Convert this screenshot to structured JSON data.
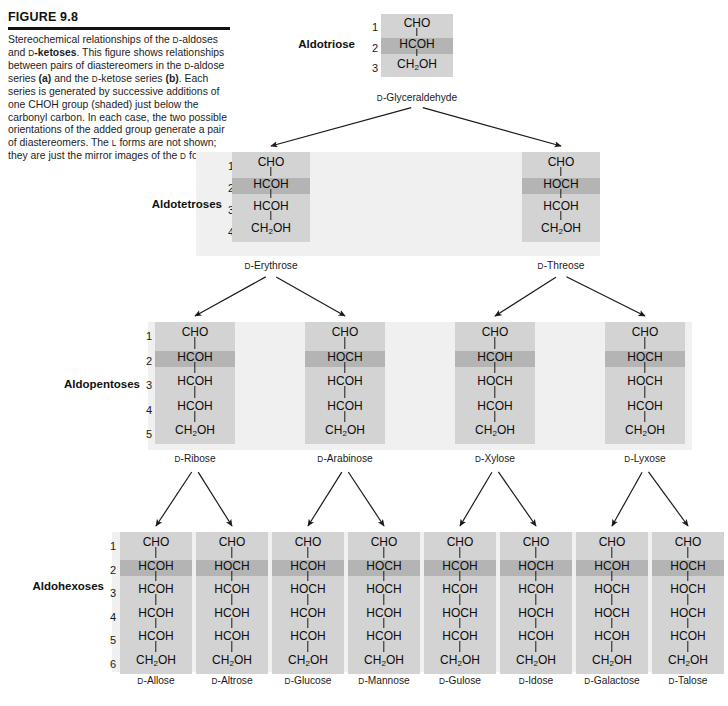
{
  "figure": {
    "number": "FIGURE 9.8",
    "caption_runs": [
      {
        "t": "Stereochemical relationships of the ",
        "s": "n"
      },
      {
        "t": "D",
        "s": "sc"
      },
      {
        "t": "-aldoses and ",
        "s": "n"
      },
      {
        "t": "D",
        "s": "sc"
      },
      {
        "t": "-ketoses",
        "s": "b"
      },
      {
        "t": ". This figure shows relationships between pairs of diastereomers in the ",
        "s": "n"
      },
      {
        "t": "D",
        "s": "sc"
      },
      {
        "t": "-aldose series ",
        "s": "n"
      },
      {
        "t": "(a)",
        "s": "b"
      },
      {
        "t": " and the ",
        "s": "n"
      },
      {
        "t": "D",
        "s": "sc"
      },
      {
        "t": "-ketose series ",
        "s": "n"
      },
      {
        "t": "(b)",
        "s": "b"
      },
      {
        "t": ". Each series is generated by successive additions of one CHOH group (shaded) just below the carbonyl carbon. In each case, the two possible orientations of the added group generate a pair of diastereomers. The ",
        "s": "n"
      },
      {
        "t": "L",
        "s": "sc"
      },
      {
        "t": " forms are not shown; they are just the mirror images of the ",
        "s": "n"
      },
      {
        "t": "D",
        "s": "sc"
      },
      {
        "t": " forms.",
        "s": "n"
      }
    ]
  },
  "colors": {
    "molecule_box": "#d3d3d3",
    "highlight_band": "#b4b4b4",
    "row_band": "#f0f0f0",
    "text": "#1a1a1a",
    "rule": "#111111"
  },
  "rows": [
    {
      "label": "Aldotriose",
      "carbon_numbers": [
        "1",
        "2",
        "3"
      ],
      "molecules": [
        {
          "name_prefix": "D",
          "name": "-Glyceraldehyde",
          "groups": [
            "CHO",
            "HCOH",
            "CH2OH"
          ],
          "highlight_index": 1
        }
      ]
    },
    {
      "label": "Aldotetroses",
      "carbon_numbers": [
        "1",
        "2",
        "3",
        "4"
      ],
      "molecules": [
        {
          "name_prefix": "D",
          "name": "-Erythrose",
          "groups": [
            "CHO",
            "HCOH",
            "HCOH",
            "CH2OH"
          ],
          "highlight_index": 1
        },
        {
          "name_prefix": "D",
          "name": "-Threose",
          "groups": [
            "CHO",
            "HOCH",
            "HCOH",
            "CH2OH"
          ],
          "highlight_index": 1
        }
      ]
    },
    {
      "label": "Aldopentoses",
      "carbon_numbers": [
        "1",
        "2",
        "3",
        "4",
        "5"
      ],
      "molecules": [
        {
          "name_prefix": "D",
          "name": "-Ribose",
          "groups": [
            "CHO",
            "HCOH",
            "HCOH",
            "HCOH",
            "CH2OH"
          ],
          "highlight_index": 1
        },
        {
          "name_prefix": "D",
          "name": "-Arabinose",
          "groups": [
            "CHO",
            "HOCH",
            "HCOH",
            "HCOH",
            "CH2OH"
          ],
          "highlight_index": 1
        },
        {
          "name_prefix": "D",
          "name": "-Xylose",
          "groups": [
            "CHO",
            "HCOH",
            "HOCH",
            "HCOH",
            "CH2OH"
          ],
          "highlight_index": 1
        },
        {
          "name_prefix": "D",
          "name": "-Lyxose",
          "groups": [
            "CHO",
            "HOCH",
            "HOCH",
            "HCOH",
            "CH2OH"
          ],
          "highlight_index": 1
        }
      ]
    },
    {
      "label": "Aldohexoses",
      "carbon_numbers": [
        "1",
        "2",
        "3",
        "4",
        "5",
        "6"
      ],
      "molecules": [
        {
          "name_prefix": "D",
          "name": "-Allose",
          "groups": [
            "CHO",
            "HCOH",
            "HCOH",
            "HCOH",
            "HCOH",
            "CH2OH"
          ],
          "highlight_index": 1
        },
        {
          "name_prefix": "D",
          "name": "-Altrose",
          "groups": [
            "CHO",
            "HOCH",
            "HCOH",
            "HCOH",
            "HCOH",
            "CH2OH"
          ],
          "highlight_index": 1
        },
        {
          "name_prefix": "D",
          "name": "-Glucose",
          "groups": [
            "CHO",
            "HCOH",
            "HOCH",
            "HCOH",
            "HCOH",
            "CH2OH"
          ],
          "highlight_index": 1
        },
        {
          "name_prefix": "D",
          "name": "-Mannose",
          "groups": [
            "CHO",
            "HOCH",
            "HOCH",
            "HCOH",
            "HCOH",
            "CH2OH"
          ],
          "highlight_index": 1
        },
        {
          "name_prefix": "D",
          "name": "-Gulose",
          "groups": [
            "CHO",
            "HCOH",
            "HCOH",
            "HOCH",
            "HCOH",
            "CH2OH"
          ],
          "highlight_index": 1
        },
        {
          "name_prefix": "D",
          "name": "-Idose",
          "groups": [
            "CHO",
            "HOCH",
            "HCOH",
            "HOCH",
            "HCOH",
            "CH2OH"
          ],
          "highlight_index": 1
        },
        {
          "name_prefix": "D",
          "name": "-Galactose",
          "groups": [
            "CHO",
            "HCOH",
            "HOCH",
            "HOCH",
            "HCOH",
            "CH2OH"
          ],
          "highlight_index": 1
        },
        {
          "name_prefix": "D",
          "name": "-Talose",
          "groups": [
            "CHO",
            "HOCH",
            "HOCH",
            "HOCH",
            "HCOH",
            "CH2OH"
          ],
          "highlight_index": 1
        }
      ]
    }
  ]
}
